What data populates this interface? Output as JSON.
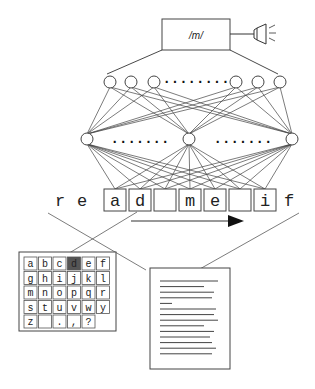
{
  "output_unit": {
    "label": "/m/"
  },
  "output_device": {
    "icon": "speaker-icon"
  },
  "layers": {
    "output_layer": {
      "visible_nodes": 6,
      "ellipsis": "........"
    },
    "hidden_layer": {
      "visible_nodes": 3,
      "ellipsis": "......."
    }
  },
  "input_window": {
    "context_left": [
      "r",
      "e"
    ],
    "window": [
      "a",
      "d",
      "",
      "m",
      "e",
      "",
      "i"
    ],
    "context_right": [
      "f"
    ],
    "direction": "right-arrow"
  },
  "letter_grid": {
    "rows": [
      [
        "a",
        "b",
        "c",
        "d",
        "e",
        "f"
      ],
      [
        "g",
        "h",
        "i",
        "j",
        "k",
        "l"
      ],
      [
        "m",
        "n",
        "o",
        "p",
        "q",
        "r"
      ],
      [
        "s",
        "t",
        "u",
        "v",
        "w",
        "y"
      ],
      [
        "z",
        "",
        ".",
        ",",
        "?"
      ]
    ],
    "highlighted": "d",
    "highlight_color": "#555555"
  },
  "document": {
    "icon": "document-icon",
    "line_count": 14
  }
}
